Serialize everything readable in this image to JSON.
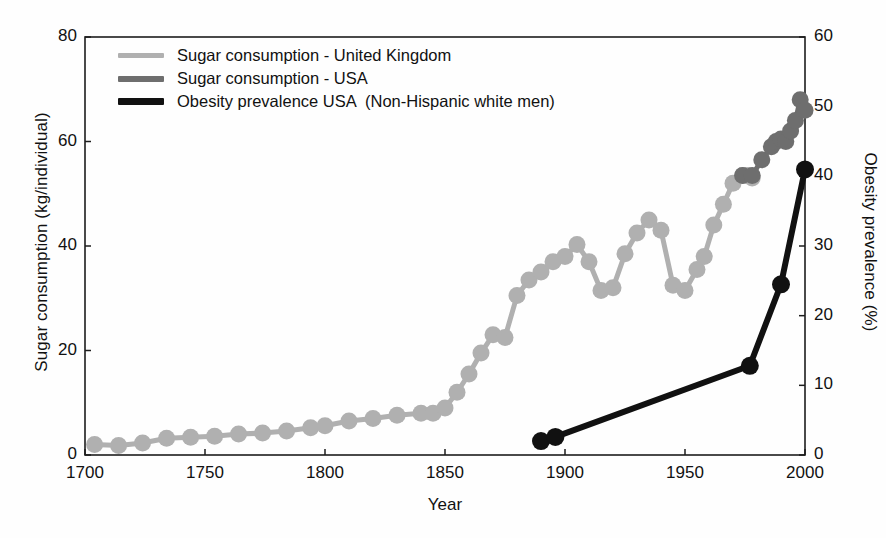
{
  "chart_data": {
    "type": "line",
    "title": "",
    "xlabel": "Year",
    "ylabel": "Sugar consumption (kg/individual)",
    "ylabel_right": "Obesity prevalence (%)",
    "xlim": [
      1700,
      2000
    ],
    "ylim": [
      0,
      80
    ],
    "ylim_right": [
      0,
      60
    ],
    "xticks": [
      1700,
      1750,
      1800,
      1850,
      1900,
      1950,
      2000
    ],
    "yticks_left": [
      0,
      20,
      40,
      60,
      80
    ],
    "yticks_right": [
      0,
      10,
      20,
      30,
      40,
      50,
      60
    ],
    "grid": false,
    "legend_position": "top-left",
    "series": [
      {
        "name": "Sugar consumption - United Kingdom",
        "color": "#b0b0b0",
        "axis": "left",
        "marker": "circle",
        "x": [
          1704,
          1714,
          1724,
          1734,
          1744,
          1754,
          1764,
          1774,
          1784,
          1794,
          1800,
          1810,
          1820,
          1830,
          1840,
          1845,
          1850,
          1855,
          1860,
          1865,
          1870,
          1875,
          1880,
          1885,
          1890,
          1895,
          1900,
          1905,
          1910,
          1915,
          1920,
          1925,
          1930,
          1935,
          1940,
          1945,
          1950,
          1955,
          1958,
          1962,
          1966,
          1970,
          1974,
          1976,
          1978
        ],
        "y": [
          2.0,
          1.8,
          2.3,
          3.2,
          3.4,
          3.6,
          4.0,
          4.2,
          4.6,
          5.2,
          5.6,
          6.5,
          7.0,
          7.6,
          8.0,
          8.0,
          9.0,
          12.0,
          15.5,
          19.5,
          23.0,
          22.5,
          30.5,
          33.5,
          35.0,
          37.0,
          38.0,
          40.3,
          37.0,
          31.5,
          32.0,
          38.5,
          42.5,
          45.0,
          43.0,
          32.5,
          31.5,
          35.5,
          38.0,
          44.0,
          48.0,
          52.0,
          53.5,
          53.5,
          53.0
        ]
      },
      {
        "name": "Sugar consumption - USA",
        "color": "#6e6e6e",
        "axis": "left",
        "marker": "circle",
        "x": [
          1974,
          1978,
          1982,
          1986,
          1988,
          1990,
          1992,
          1994,
          1996,
          1998,
          2000
        ],
        "y": [
          53.5,
          53.5,
          56.5,
          59.0,
          60.0,
          60.5,
          60.0,
          62.0,
          64.0,
          68.0,
          66.0
        ]
      },
      {
        "name": "Obesity prevalence USA  (Non-Hispanic white men)",
        "color": "#111111",
        "axis": "right",
        "marker": "circle",
        "x": [
          1890,
          1896,
          1977,
          1990,
          2000
        ],
        "y": [
          2.0,
          2.6,
          12.8,
          24.5,
          41.0
        ]
      }
    ]
  },
  "legend": {
    "items": [
      {
        "label": "Sugar consumption - United Kingdom",
        "color": "#b0b0b0"
      },
      {
        "label": "Sugar consumption - USA",
        "color": "#6e6e6e"
      },
      {
        "label": "Obesity prevalence USA  (Non-Hispanic white men)",
        "color": "#111111"
      }
    ]
  },
  "axes": {
    "left_title": "Sugar consumption (kg/individual)",
    "right_title": "Obesity prevalence (%)",
    "x_title": "Year",
    "left_ticks": [
      "0",
      "20",
      "40",
      "60",
      "80"
    ],
    "right_ticks": [
      "0",
      "10",
      "20",
      "30",
      "40",
      "50",
      "60"
    ],
    "x_ticks": [
      "1700",
      "1750",
      "1800",
      "1850",
      "1900",
      "1950",
      "2000"
    ]
  }
}
